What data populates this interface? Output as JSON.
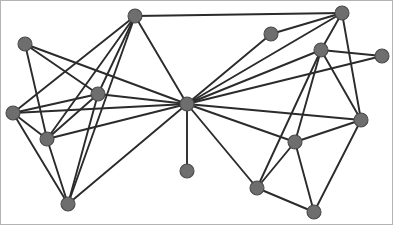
{
  "figure": {
    "background_color": "#ffffff",
    "border_color": "#b4b4b4",
    "width": 393,
    "height": 225
  },
  "style": {
    "node_fill": "#6e6e6e",
    "node_stroke": "#4a4a4a",
    "node_radius": 7,
    "edge_color": "#2b2b2b",
    "edge_width": 1.9
  },
  "chart_data": {
    "type": "graph",
    "title": "",
    "xlabel": "",
    "ylabel": "",
    "directed": false,
    "weighted": false,
    "grid": false,
    "legend": "none",
    "node_count": 16,
    "edge_count": 38,
    "xlim": [
      0,
      393
    ],
    "ylim": [
      0,
      225
    ],
    "nodes": [
      {
        "id": "n0",
        "label": "",
        "x": 24,
        "y": 43,
        "degree": 3
      },
      {
        "id": "n1",
        "label": "",
        "x": 134,
        "y": 15,
        "degree": 6
      },
      {
        "id": "n2",
        "label": "",
        "x": 97,
        "y": 93,
        "degree": 6
      },
      {
        "id": "n3",
        "label": "",
        "x": 12,
        "y": 112,
        "degree": 5
      },
      {
        "id": "n4",
        "label": "",
        "x": 46,
        "y": 138,
        "degree": 6
      },
      {
        "id": "n5",
        "label": "",
        "x": 67,
        "y": 203,
        "degree": 5
      },
      {
        "id": "n6",
        "label": "",
        "x": 186,
        "y": 103,
        "degree": 14
      },
      {
        "id": "n7",
        "label": "",
        "x": 186,
        "y": 170,
        "degree": 1
      },
      {
        "id": "n8",
        "label": "",
        "x": 270,
        "y": 33,
        "degree": 3
      },
      {
        "id": "n9",
        "label": "",
        "x": 320,
        "y": 49,
        "degree": 6
      },
      {
        "id": "n10",
        "label": "",
        "x": 341,
        "y": 12,
        "degree": 5
      },
      {
        "id": "n11",
        "label": "",
        "x": 381,
        "y": 55,
        "degree": 3
      },
      {
        "id": "n12",
        "label": "",
        "x": 360,
        "y": 119,
        "degree": 5
      },
      {
        "id": "n13",
        "label": "",
        "x": 294,
        "y": 141,
        "degree": 5
      },
      {
        "id": "n14",
        "label": "",
        "x": 256,
        "y": 187,
        "degree": 4
      },
      {
        "id": "n15",
        "label": "",
        "x": 313,
        "y": 211,
        "degree": 3
      }
    ],
    "edges": [
      {
        "source": "n0",
        "target": "n4"
      },
      {
        "source": "n0",
        "target": "n2"
      },
      {
        "source": "n0",
        "target": "n6"
      },
      {
        "source": "n1",
        "target": "n10"
      },
      {
        "source": "n1",
        "target": "n2"
      },
      {
        "source": "n1",
        "target": "n4"
      },
      {
        "source": "n1",
        "target": "n5"
      },
      {
        "source": "n1",
        "target": "n6"
      },
      {
        "source": "n1",
        "target": "n3"
      },
      {
        "source": "n2",
        "target": "n3"
      },
      {
        "source": "n2",
        "target": "n5"
      },
      {
        "source": "n2",
        "target": "n4"
      },
      {
        "source": "n2",
        "target": "n6"
      },
      {
        "source": "n3",
        "target": "n4"
      },
      {
        "source": "n3",
        "target": "n5"
      },
      {
        "source": "n3",
        "target": "n6"
      },
      {
        "source": "n4",
        "target": "n5"
      },
      {
        "source": "n4",
        "target": "n6"
      },
      {
        "source": "n5",
        "target": "n6"
      },
      {
        "source": "n6",
        "target": "n7"
      },
      {
        "source": "n6",
        "target": "n8"
      },
      {
        "source": "n6",
        "target": "n9"
      },
      {
        "source": "n6",
        "target": "n10"
      },
      {
        "source": "n6",
        "target": "n11"
      },
      {
        "source": "n6",
        "target": "n12"
      },
      {
        "source": "n6",
        "target": "n13"
      },
      {
        "source": "n6",
        "target": "n14"
      },
      {
        "source": "n8",
        "target": "n10"
      },
      {
        "source": "n9",
        "target": "n10"
      },
      {
        "source": "n9",
        "target": "n11"
      },
      {
        "source": "n9",
        "target": "n12"
      },
      {
        "source": "n9",
        "target": "n13"
      },
      {
        "source": "n9",
        "target": "n14"
      },
      {
        "source": "n10",
        "target": "n12"
      },
      {
        "source": "n12",
        "target": "n13"
      },
      {
        "source": "n12",
        "target": "n15"
      },
      {
        "source": "n13",
        "target": "n14"
      },
      {
        "source": "n13",
        "target": "n15"
      },
      {
        "source": "n14",
        "target": "n15"
      }
    ]
  }
}
